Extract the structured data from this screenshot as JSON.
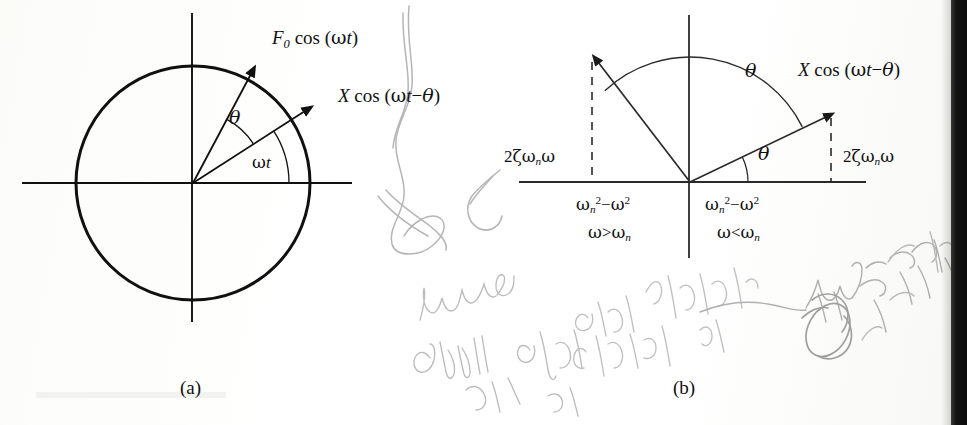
{
  "figure": {
    "kind": "vector-phasor-diagram",
    "panels": [
      {
        "id": "a",
        "caption": "(a)",
        "labels": {
          "force": "F0 cos (ωt)",
          "force_parts": {
            "base": "F",
            "sub": "0",
            "rest": " cos (ωt)"
          },
          "response": "X cos (ωt−θ)",
          "angle_theta": "θ",
          "angle_omega_t": "ωt"
        },
        "geometry": {
          "origin": [
            193,
            183
          ],
          "circle_radius": 117,
          "force_arrow_angle_deg": 62,
          "response_arrow_angle_deg": 33,
          "theta_arc_radius": 72,
          "omega_arc_radius": 96
        }
      },
      {
        "id": "b",
        "caption": "(b)",
        "labels": {
          "damping_left": "2ζωnω",
          "damping_right": "2ζωnω",
          "stiffness_left": "ωn²−ω²",
          "condition_left": "ω>ωn",
          "stiffness_right": "ωn²−ω²",
          "condition_right": "ω<ωn",
          "response": "X cos (ωt−θ)",
          "theta_upper": "θ",
          "theta_lower": "θ"
        },
        "geometry": {
          "origin": [
            690,
            182
          ],
          "axis_x_range": [
            519,
            866
          ],
          "axis_y_range": [
            15,
            258
          ],
          "arc_radius": 125,
          "left_vector_angle_deg": 133,
          "right_vector_angle_deg": 26,
          "left_dashed_x": 592,
          "right_dashed_x": 831
        }
      }
    ]
  },
  "annotations": {
    "type": "handwritten-pencil-scribble",
    "legible": false,
    "description": "illegible cursive pencil notes across the lower half and left of panel b"
  },
  "colors": {
    "ink": "#101010",
    "paper": "#ffffff",
    "pencil": "#b9b9b9",
    "scan_edge": "#0b0b0b"
  }
}
